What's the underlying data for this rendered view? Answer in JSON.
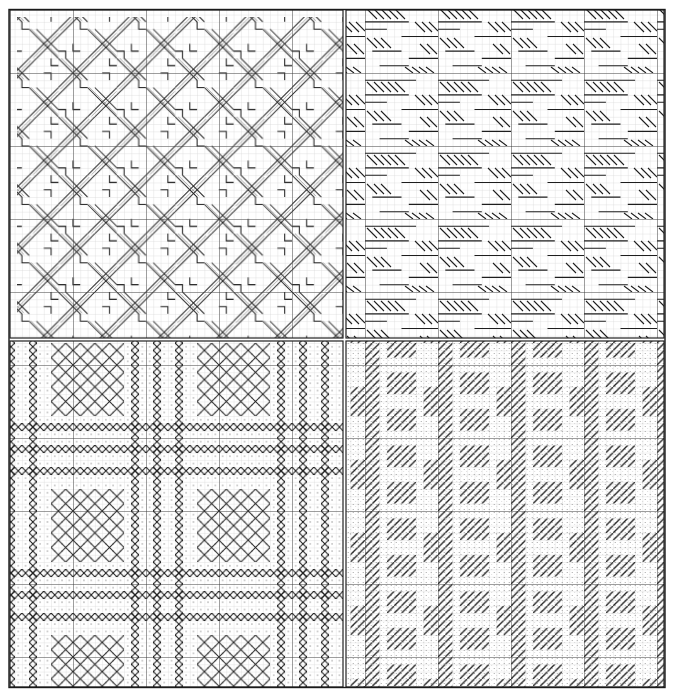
{
  "chart": {
    "kind": "needlepoint-stitch-chart",
    "panel_count": 4,
    "outer_bounds": {
      "x": 9,
      "y": 10,
      "w": 655,
      "h": 677
    },
    "cell_size": 7.3,
    "major_every": 10,
    "colors": {
      "background": "#ffffff",
      "minor_grid": "#c8c8c8",
      "major_grid": "#333333",
      "stitch": "#1e1e1e",
      "dot": "#777777"
    },
    "panels": [
      {
        "id": "top-left",
        "pattern": "interlaced-basketweave",
        "x": 10,
        "y": 10,
        "w": 333,
        "h": 328,
        "description": "Woven lattice of bold diagonal bands in both directions with hatched fills"
      },
      {
        "id": "top-right",
        "pattern": "horizontal-bars-backslash",
        "x": 346,
        "y": 10,
        "w": 318,
        "h": 328,
        "description": "Horizontal straight stitches alternating with descending (backslash) diagonal stitches"
      },
      {
        "id": "bottom-left",
        "pattern": "plaid-cross-stitch",
        "x": 10,
        "y": 341,
        "w": 333,
        "h": 346,
        "description": "Plaid of cross-stitch bands framing diamond lattice squares on a dotted ground"
      },
      {
        "id": "bottom-right",
        "pattern": "slanted-plaid-dotted",
        "x": 346,
        "y": 341,
        "w": 318,
        "h": 346,
        "description": "Ascending (slash) diagonal stitch blocks forming plaid over a stippled ground"
      }
    ]
  }
}
